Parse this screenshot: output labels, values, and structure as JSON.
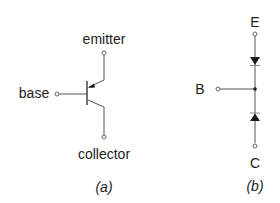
{
  "diagram": {
    "panel_a": {
      "caption": "(a)",
      "symbol": "pnp-transistor",
      "terminals": {
        "emitter": "emitter",
        "base": "base",
        "collector": "collector"
      }
    },
    "panel_b": {
      "caption": "(b)",
      "symbol": "two-diode-equivalent",
      "terminals": {
        "emitter": "E",
        "base": "B",
        "collector": "C"
      }
    },
    "colors": {
      "line": "#555555",
      "text": "#222222",
      "fill": "#1a1a1a",
      "background": "#ffffff"
    }
  }
}
